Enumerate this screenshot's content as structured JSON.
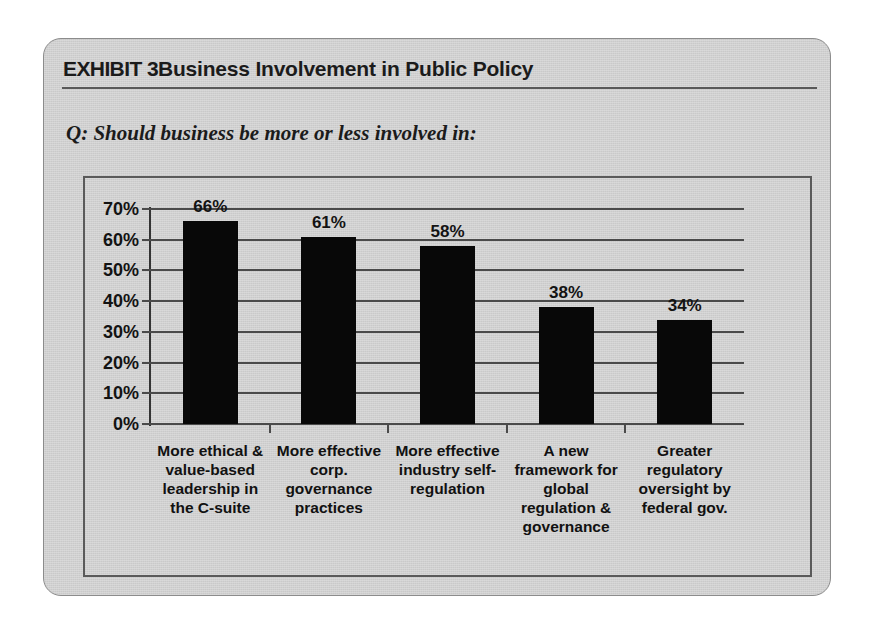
{
  "exhibit": {
    "kicker": "EXHIBIT 3",
    "title": "Business Involvement in Public Policy",
    "question": "Q: Should business be more or less involved in:"
  },
  "chart_data": {
    "type": "bar",
    "title": "Business Involvement in Public Policy",
    "subtitle": "Q: Should business be more or less involved in:",
    "xlabel": "",
    "ylabel": "",
    "ylim": [
      0,
      70
    ],
    "ytick_step": 10,
    "grid": true,
    "legend": "none",
    "value_labels": true,
    "bar_color": "#080808",
    "categories": [
      "More ethical & value-based leadership in the C-suite",
      "More effective corp. governance practices",
      "More effective industry self-regulation",
      "A new framework for global regulation & governance",
      "Greater regulatory oversight by federal gov."
    ],
    "category_lines": [
      [
        "More ethical &",
        "value-based",
        "leadership in",
        "the C-suite"
      ],
      [
        "More effective",
        "corp.",
        "governance",
        "practices"
      ],
      [
        "More effective",
        "industry self-",
        "regulation"
      ],
      [
        "A new",
        "framework for",
        "global",
        "regulation &",
        "governance"
      ],
      [
        "Greater",
        "regulatory",
        "oversight by",
        "federal gov."
      ]
    ],
    "values": [
      66,
      61,
      58,
      38,
      34
    ],
    "value_label_texts": [
      "66%",
      "61%",
      "58%",
      "38%",
      "34%"
    ],
    "ytick_labels": [
      "70%",
      "60%",
      "50%",
      "40%",
      "30%",
      "20%",
      "10%",
      "0%"
    ],
    "ytick_values": [
      70,
      60,
      50,
      40,
      30,
      20,
      10,
      0
    ]
  }
}
